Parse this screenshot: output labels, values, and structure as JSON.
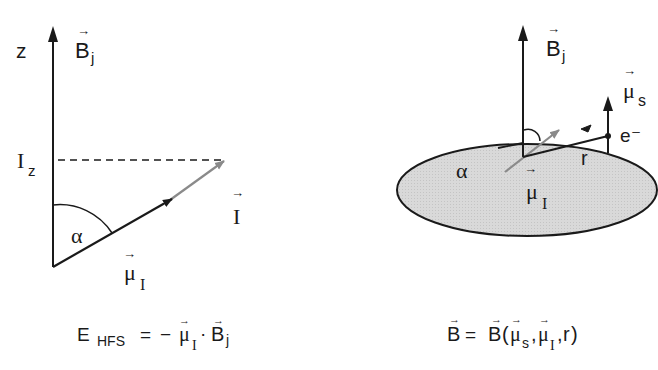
{
  "left_panel": {
    "axis_label": "z",
    "field_label": "B",
    "field_sub": "j",
    "projection_label": "I",
    "projection_sub": "z",
    "angle_label": "α",
    "spin_label": "I",
    "moment_label": "μ",
    "moment_sub": "I",
    "equation": {
      "lhs": "E",
      "lhs_sub": "HFS",
      "eq": "=",
      "minus": "−",
      "mu": "μ",
      "mu_sub": "I",
      "dot": "·",
      "B": "B",
      "B_sub": "j"
    }
  },
  "right_panel": {
    "field_label": "B",
    "field_sub": "j",
    "electron_moment_label": "μ",
    "electron_moment_sub": "s",
    "electron_label": "e⁻",
    "radius_label": "r",
    "angle_label": "α",
    "nuclear_moment_label": "μ",
    "nuclear_moment_sub": "I",
    "equation": {
      "lhs": "B",
      "eq": "=",
      "fn": "B",
      "open": "(",
      "arg1": "μ",
      "arg1_sub": "s",
      "comma1": ",",
      "arg2": "μ",
      "arg2_sub": "I",
      "comma2": ",",
      "arg3": "r",
      "close": ")"
    }
  },
  "colors": {
    "ink": "#1a1a1a",
    "gray_arrow": "#8a8a8a",
    "disk_fill": "#d6d6d6"
  }
}
